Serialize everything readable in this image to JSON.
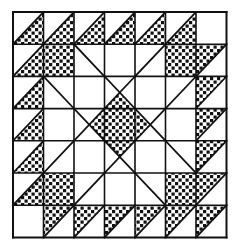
{
  "grid": {
    "rows": 7,
    "cols": 7,
    "origin_x": 13,
    "origin_y": 12,
    "cell_w": 30.5,
    "cell_h": 32.2
  },
  "colors": {
    "line": "#111111",
    "background": "#ffffff",
    "checker_dot": "#111111"
  },
  "legend": {
    "D": "diagonal / (bottom-left to top-right)",
    "B": "diagonal \\ (top-left to bottom-right)",
    "X": "both diagonals",
    "fill_codes": "br=bottom-right half, tl=top-left half, tr=top-right half, bl=bottom-left half, full, qt/qb/ql/qr=quarter triangles"
  },
  "cells": [
    [
      "D:br",
      "D:br",
      "D:br",
      "D:br",
      "D:br",
      "D:br",
      "-"
    ],
    [
      "D:br",
      "-:full",
      "B",
      "-",
      "D",
      "-:full",
      "D:tl"
    ],
    [
      "D:br",
      "B",
      "-",
      "X:qb",
      "-",
      "D",
      "D:tl"
    ],
    [
      "D:br",
      "-",
      "X:qr",
      "-:full",
      "X:ql",
      "-",
      "D:tl"
    ],
    [
      "D:br",
      "D",
      "-",
      "X:qt",
      "-",
      "B",
      "D:tl"
    ],
    [
      "D:br",
      "-:full",
      "D",
      "-",
      "B",
      "-:full",
      "D:tl"
    ],
    [
      "-",
      "D:tl",
      "D:tl",
      "D:tl",
      "D:tl",
      "D:tl",
      "D:tl"
    ]
  ]
}
